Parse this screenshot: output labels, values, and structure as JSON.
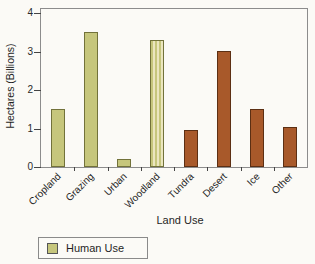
{
  "figure": {
    "background": "#fbfaf6"
  },
  "chart_data": {
    "type": "bar",
    "title": "",
    "xlabel": "Land Use",
    "ylabel": "Hectares (Billions)",
    "categories": [
      "Cropland",
      "Grazing",
      "Urban",
      "Woodland",
      "Tundra",
      "Desert",
      "Ice",
      "Other"
    ],
    "values": [
      1.5,
      3.5,
      0.2,
      3.3,
      0.95,
      3.0,
      1.5,
      1.05
    ],
    "bar_groups": [
      "human",
      "human",
      "human",
      "human",
      "natural",
      "natural",
      "natural",
      "natural"
    ],
    "bar_textures": [
      "solid",
      "solid",
      "solid",
      "stripes",
      "solid",
      "solid",
      "solid",
      "solid"
    ],
    "colors": {
      "human": "#c6c67c",
      "human_border": "#72723a",
      "human_stripe_alt": "#ebe6bf",
      "natural": "#a8592a",
      "natural_border": "#5c2f13"
    },
    "ylim": [
      0,
      4
    ],
    "yticks": [
      0,
      1,
      2,
      3,
      4
    ],
    "grid": false,
    "legend": {
      "label": "Human Use",
      "swatch_color": "#c6c67c",
      "position": "bottom-left"
    }
  }
}
